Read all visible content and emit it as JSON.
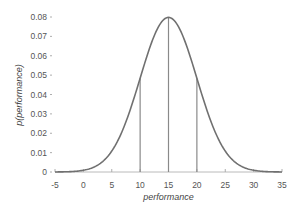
{
  "chart_data": {
    "type": "line",
    "title": "",
    "xlabel": "performance",
    "ylabel": "p(performance)",
    "xlim": [
      -5,
      35
    ],
    "ylim": [
      0,
      0.08
    ],
    "x_ticks": [
      -5,
      0,
      5,
      10,
      15,
      20,
      25,
      30,
      35
    ],
    "x_tick_labels": [
      "-5",
      "0",
      "5",
      "10",
      "15",
      "20",
      "25",
      "30",
      "35"
    ],
    "y_ticks": [
      0,
      0.01,
      0.02,
      0.03,
      0.04,
      0.05,
      0.06,
      0.07,
      0.08
    ],
    "y_tick_labels": [
      "0",
      "0.01",
      "0.02",
      "0.03",
      "0.04",
      "0.05",
      "0.06",
      "0.07",
      "0.08"
    ],
    "grid": false,
    "legend": null,
    "series": [
      {
        "name": "normal density",
        "distribution": "normal",
        "mean": 15,
        "sd": 5,
        "x": [
          -5,
          0,
          5,
          7.5,
          10,
          12.5,
          15,
          17.5,
          20,
          22.5,
          25,
          30,
          35
        ],
        "values": [
          2.68e-05,
          0.000886,
          0.0108,
          0.0259,
          0.0484,
          0.0704,
          0.0798,
          0.0704,
          0.0484,
          0.0259,
          0.0108,
          0.000886,
          2.68e-05
        ],
        "color": "#707070"
      }
    ],
    "annotations": [
      {
        "type": "vline",
        "x": 10,
        "y_top": 0.0484,
        "label": "mean - 1 sd"
      },
      {
        "type": "vline",
        "x": 15,
        "y_top": 0.0798,
        "label": "mean"
      },
      {
        "type": "vline",
        "x": 20,
        "y_top": 0.0484,
        "label": "mean + 1 sd"
      }
    ],
    "colors": {
      "curve": "#707070",
      "vlines": "#8a8a8a",
      "axis": "#999999",
      "text": "#555555"
    }
  }
}
